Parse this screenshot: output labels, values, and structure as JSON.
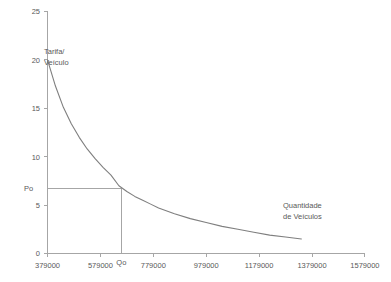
{
  "chart_data": {
    "type": "line",
    "title": "",
    "subtitle": "",
    "xlabel": "Quantidade de Veículos",
    "ylabel": "Tarifa/ Veículo",
    "xlabel_line1": "Quantidade",
    "xlabel_line2": "de Veículos",
    "ylabel_line1": "Tarifa/",
    "ylabel_line2": "Veículo",
    "grid": false,
    "legend": "none",
    "xlim": [
      379000,
      1579000
    ],
    "ylim": [
      0,
      25
    ],
    "xticks": [
      379000,
      579000,
      779000,
      979000,
      1179000,
      1379000,
      1579000
    ],
    "xtick_labels": [
      "379000",
      "579000",
      "779000",
      "979000",
      "1179000",
      "1379000",
      "1579000"
    ],
    "yticks": [
      0,
      5,
      10,
      15,
      20,
      25
    ],
    "ytick_labels": [
      "0",
      "5",
      "10",
      "15",
      "20",
      "25"
    ],
    "series": [
      {
        "name": "Curva de demanda",
        "color": "#7f7f7f",
        "x": [
          379000,
          409000,
          439000,
          469000,
          499000,
          529000,
          559000,
          589000,
          619000,
          649000,
          679000,
          709000,
          739000,
          769000,
          799000,
          859000,
          919000,
          979000,
          1039000,
          1099000,
          1159000,
          1219000,
          1279000,
          1339000
        ],
        "y": [
          20.0,
          17.3,
          15.1,
          13.4,
          12.0,
          10.8,
          9.8,
          8.9,
          8.1,
          7.0,
          6.4,
          5.9,
          5.5,
          5.1,
          4.7,
          4.1,
          3.6,
          3.2,
          2.8,
          2.5,
          2.2,
          1.9,
          1.7,
          1.5
        ]
      }
    ],
    "annotations": [
      {
        "name": "equilibrium-price",
        "label": "Po",
        "axis": "y",
        "value": 6.7,
        "line": "horizontal-from-axis-to-curve"
      },
      {
        "name": "equilibrium-quantity",
        "label": "Qo",
        "axis": "x",
        "value": 660000,
        "line": "vertical-from-axis-to-curve"
      }
    ],
    "colors": {
      "curve": "#7f7f7f",
      "axis": "#a6a6a6",
      "guide": "#a6a6a6",
      "text": "#595959",
      "background": "#ffffff"
    }
  }
}
